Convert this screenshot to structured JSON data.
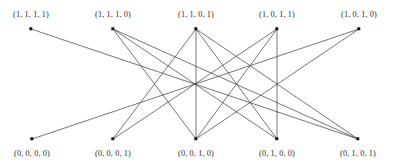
{
  "figure": {
    "type": "bipartite-graph-diagram",
    "width": 394,
    "height": 168,
    "background_color": "#ffffff",
    "edge_color": "#3a3a3a",
    "node_color": "#111111",
    "label_color": "#2b2b2b"
  },
  "nodes": {
    "top": [
      {
        "id": "T1",
        "label": "(1, 1, 1, 1)",
        "x": 31,
        "y": 29,
        "label_x": 31,
        "label_y": 11
      },
      {
        "id": "T2",
        "label": "(1, 1, 1, 0)",
        "x": 113,
        "y": 29,
        "label_x": 113,
        "label_y": 11
      },
      {
        "id": "T3",
        "label": "(1, 1, 0, 1)",
        "x": 196,
        "y": 29,
        "label_x": 196,
        "label_y": 11
      },
      {
        "id": "T4",
        "label": "(1, 0, 1, 1)",
        "x": 277,
        "y": 29,
        "label_x": 277,
        "label_y": 11
      },
      {
        "id": "T5",
        "label": "(1, 0, 1, 0)",
        "x": 359,
        "y": 29,
        "label_x": 359,
        "label_y": 11
      }
    ],
    "bottom": [
      {
        "id": "B1",
        "label": "(0, 0, 0, 0)",
        "x": 32,
        "y": 139,
        "label_x": 32,
        "label_y": 150
      },
      {
        "id": "B2",
        "label": "(0, 0, 0, 1)",
        "x": 113,
        "y": 139,
        "label_x": 113,
        "label_y": 150
      },
      {
        "id": "B3",
        "label": "(0, 0, 1, 0)",
        "x": 196,
        "y": 139,
        "label_x": 196,
        "label_y": 150
      },
      {
        "id": "B4",
        "label": "(0, 1, 0, 0)",
        "x": 277,
        "y": 139,
        "label_x": 277,
        "label_y": 150
      },
      {
        "id": "B5",
        "label": "(0, 1, 0, 1)",
        "x": 358,
        "y": 139,
        "label_x": 358,
        "label_y": 150
      }
    ]
  },
  "edges": [
    {
      "from": "T1",
      "to": "B5"
    },
    {
      "from": "T2",
      "to": "B3"
    },
    {
      "from": "T2",
      "to": "B4"
    },
    {
      "from": "T2",
      "to": "B5"
    },
    {
      "from": "T3",
      "to": "B2"
    },
    {
      "from": "T3",
      "to": "B3"
    },
    {
      "from": "T3",
      "to": "B4"
    },
    {
      "from": "T3",
      "to": "B5"
    },
    {
      "from": "T4",
      "to": "B2"
    },
    {
      "from": "T4",
      "to": "B3"
    },
    {
      "from": "T4",
      "to": "B4"
    },
    {
      "from": "T5",
      "to": "B1"
    },
    {
      "from": "T5",
      "to": "B3"
    }
  ]
}
